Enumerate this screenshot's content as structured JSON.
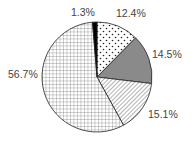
{
  "chart_data": {
    "type": "pie",
    "title": "",
    "start_angle": "top (12 o'clock), clockwise",
    "slices": [
      {
        "label": "12.4%",
        "value": 12.4,
        "pattern": "dots",
        "fill": "#ffffff"
      },
      {
        "label": "14.5%",
        "value": 14.5,
        "pattern": "solid",
        "fill": "#8a8a8a"
      },
      {
        "label": "15.1%",
        "value": 15.1,
        "pattern": "diagonal-hatch",
        "fill": "#ffffff"
      },
      {
        "label": "56.7%",
        "value": 56.7,
        "pattern": "grid",
        "fill": "#ffffff"
      },
      {
        "label": "1.3%",
        "value": 1.3,
        "pattern": "solid",
        "fill": "#000000"
      }
    ],
    "legend": "none"
  },
  "labels": {
    "s0": "12.4%",
    "s1": "14.5%",
    "s2": "15.1%",
    "s3": "56.7%",
    "s4": "1.3%"
  }
}
